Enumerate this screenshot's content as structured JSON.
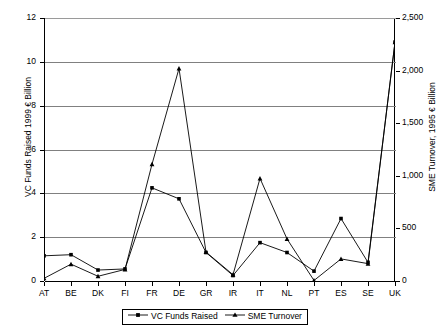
{
  "chart_data": {
    "type": "line",
    "title": "",
    "xlabel": "",
    "categories": [
      "AT",
      "BE",
      "DK",
      "FI",
      "FR",
      "DE",
      "GR",
      "IR",
      "IT",
      "NL",
      "PT",
      "ES",
      "SE",
      "UK"
    ],
    "grid": true,
    "legend_position": "bottom-center",
    "axes": {
      "left": {
        "label": "VC Funds Raised 1999 € Billion",
        "min": 0,
        "max": 12,
        "ticks": [
          0,
          2,
          4,
          6,
          8,
          10,
          12
        ],
        "tick_labels": [
          "0",
          "2",
          "4",
          "6",
          "8",
          "10",
          "12"
        ]
      },
      "right": {
        "label": "SME Turnover, 1995 € Billion",
        "min": 0,
        "max": 2500,
        "ticks": [
          0,
          500,
          1000,
          1500,
          2000,
          2500
        ],
        "tick_labels": [
          "0",
          "500",
          "1,000",
          "1,500",
          "2,000",
          "2,500"
        ]
      }
    },
    "series": [
      {
        "name": "VC Funds Raised",
        "axis": "left",
        "marker": "square",
        "color": "#000000",
        "values": [
          1.15,
          1.2,
          0.5,
          0.55,
          4.25,
          3.75,
          1.3,
          0.25,
          1.75,
          1.3,
          0.45,
          2.85,
          0.85,
          10.9
        ]
      },
      {
        "name": "SME Turnover",
        "axis": "right",
        "marker": "triangle",
        "color": "#000000",
        "values": [
          25,
          160,
          45,
          110,
          1110,
          2020,
          275,
          60,
          975,
          400,
          5,
          210,
          165,
          2270
        ]
      }
    ]
  },
  "legend": {
    "items": [
      {
        "label": "VC Funds Raised",
        "marker": "square"
      },
      {
        "label": "SME Turnover",
        "marker": "triangle"
      }
    ]
  }
}
